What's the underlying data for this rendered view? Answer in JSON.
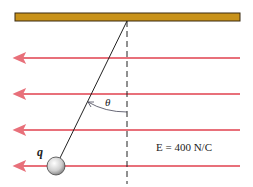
{
  "diagram": {
    "charge_label": "q",
    "angle_label": "θ",
    "field_label": "E = 400 N/C",
    "colors": {
      "ceiling": "#c8921a",
      "field_lines": "#e8707a",
      "string": "#222222"
    }
  }
}
